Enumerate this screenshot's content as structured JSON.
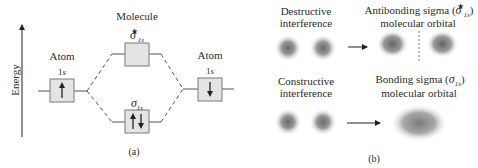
{
  "panel_a": {
    "axis_label": "Energy",
    "molecule_label": "Molecule",
    "left_atom": {
      "label": "Atom",
      "orbital": "1",
      "orbital_italic": "s",
      "electron": "up"
    },
    "right_atom": {
      "label": "Atom",
      "orbital": "1",
      "orbital_italic": "s",
      "electron": "down"
    },
    "antibonding": {
      "symbol": "σ",
      "subscript": "1s",
      "superscript": "★",
      "electrons": "empty"
    },
    "bonding": {
      "symbol": "σ",
      "subscript": "1s",
      "electrons": "up-down pair"
    },
    "caption": "(a)"
  },
  "panel_b": {
    "destructive": {
      "line1": "Destructive",
      "line2": "interference"
    },
    "antibonding": {
      "line1_prefix": "Antibonding sigma (",
      "symbol": "σ",
      "subscript": "1s",
      "superscript": "★",
      "line1_suffix": ")",
      "line2": "molecular orbital"
    },
    "constructive": {
      "line1": "Constructive",
      "line2": "interference"
    },
    "bonding": {
      "line1_prefix": "Bonding sigma (",
      "symbol": "σ",
      "subscript": "1s",
      "line1_suffix": ")",
      "line2": "molecular orbital"
    },
    "caption": "(b)"
  },
  "colors": {
    "box_fill": "#e4e4e4",
    "box_stroke": "#7a7a7a",
    "line": "#555555",
    "orbital": "#6e6e6e"
  }
}
